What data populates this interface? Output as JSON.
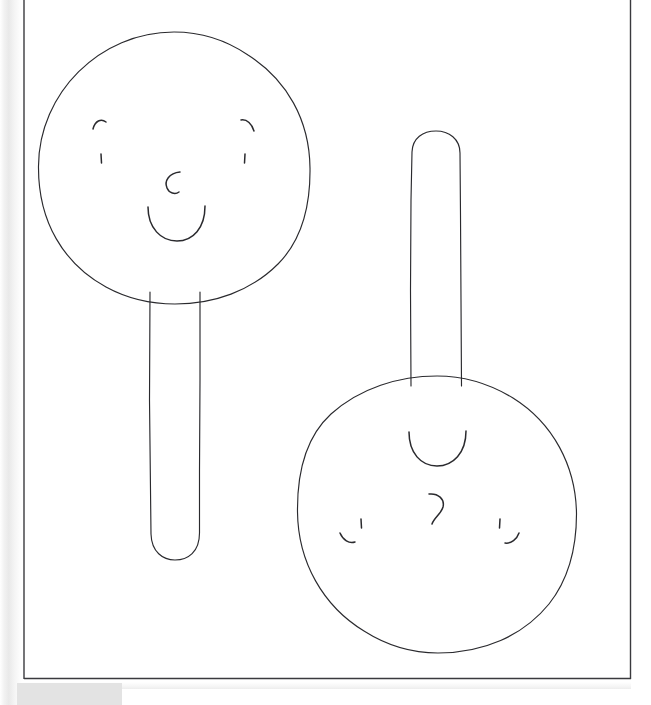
{
  "document": {
    "title": "Hand-drawn sketch of two lollipop rattles with faces",
    "medium": "pencil line drawing on white paper",
    "background_color": "#ffffff",
    "ink_color": "#2a2a2e",
    "frame_color": "#3a3a3e",
    "scan_edge_color": "#e3e3e3"
  },
  "page_frame": {
    "name": "page-border",
    "x": 23,
    "y": 0,
    "width": 608,
    "height": 679,
    "visible_sides": "left, right, bottom; top cropped"
  },
  "scan_artifacts": [
    {
      "name": "left-edge-strip",
      "color": "#e9e9e9",
      "x": 0,
      "y": 0,
      "width": 23,
      "height": 705
    },
    {
      "name": "bottom-left-shadow-block",
      "color": "#e3e3e3",
      "x": 17,
      "y": 683,
      "width": 105,
      "height": 22
    }
  ],
  "figures": [
    {
      "id": "figure-1",
      "name": "lollipop-rattle-upright",
      "label": "Upright rattle with smiling face",
      "rotation_deg": 0,
      "head": {
        "cx": 174,
        "cy": 168,
        "r": 136
      },
      "handle": {
        "x": 148,
        "y": 296,
        "width": 53,
        "height": 262,
        "rounded_end": "bottom"
      },
      "face": {
        "brow_left": {
          "cx": 99,
          "cy": 124
        },
        "brow_right": {
          "cx": 249,
          "cy": 124
        },
        "eye_left": {
          "cx": 101,
          "cy": 158
        },
        "eye_right": {
          "cx": 245,
          "cy": 158
        },
        "nose": {
          "cx": 174,
          "cy": 184,
          "shape": "C-hook"
        },
        "mouth": {
          "cx": 176,
          "cy": 222,
          "rx": 29,
          "ry": 18,
          "shape": "U-smile"
        }
      }
    },
    {
      "id": "figure-2",
      "name": "lollipop-rattle-inverted",
      "label": "Inverted rattle with same face, rotated 180 degrees",
      "rotation_deg": 180,
      "head": {
        "cx": 437,
        "cy": 515,
        "r": 140
      },
      "handle": {
        "x": 410,
        "y": 133,
        "width": 52,
        "height": 250,
        "rounded_end": "top"
      },
      "face": {
        "mouth": {
          "cx": 437,
          "cy": 450,
          "rx": 30,
          "ry": 19,
          "shape": "U-curve"
        },
        "nose": {
          "cx": 436,
          "cy": 508,
          "shape": "inverted-C-hook"
        },
        "brow_left": {
          "cx": 348,
          "cy": 541
        },
        "brow_right": {
          "cx": 512,
          "cy": 541
        },
        "eye_left": {
          "cx": 362,
          "cy": 524
        },
        "eye_right": {
          "cx": 500,
          "cy": 524
        }
      }
    }
  ]
}
